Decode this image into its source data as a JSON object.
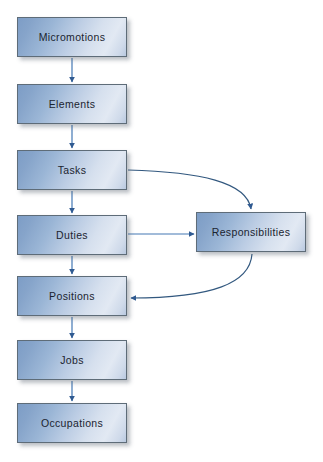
{
  "diagram": {
    "type": "flowchart",
    "background_color": "#ffffff",
    "node_fill_light": "#e2e9f3",
    "node_fill_dark": "#7d9dc6",
    "node_border_color": "#5e6c78",
    "connector_color": "#3b669e",
    "nodes": [
      {
        "id": "micromotions",
        "label": "Micromotions",
        "column": "left",
        "order": 1
      },
      {
        "id": "elements",
        "label": "Elements",
        "column": "left",
        "order": 2
      },
      {
        "id": "tasks",
        "label": "Tasks",
        "column": "left",
        "order": 3
      },
      {
        "id": "duties",
        "label": "Duties",
        "column": "left",
        "order": 4
      },
      {
        "id": "positions",
        "label": "Positions",
        "column": "left",
        "order": 5
      },
      {
        "id": "jobs",
        "label": "Jobs",
        "column": "left",
        "order": 6
      },
      {
        "id": "occupations",
        "label": "Occupations",
        "column": "left",
        "order": 7
      },
      {
        "id": "responsibilities",
        "label": "Responsibilities",
        "column": "right",
        "order": 1
      }
    ],
    "connectors": [
      {
        "id": "micromotions-to-elements",
        "from": "micromotions",
        "to": "elements",
        "style": "straight-vertical"
      },
      {
        "id": "elements-to-tasks",
        "from": "elements",
        "to": "tasks",
        "style": "straight-vertical"
      },
      {
        "id": "tasks-to-duties",
        "from": "tasks",
        "to": "duties",
        "style": "straight-vertical"
      },
      {
        "id": "duties-to-positions",
        "from": "duties",
        "to": "positions",
        "style": "straight-vertical"
      },
      {
        "id": "positions-to-jobs",
        "from": "positions",
        "to": "jobs",
        "style": "straight-vertical"
      },
      {
        "id": "jobs-to-occupations",
        "from": "jobs",
        "to": "occupations",
        "style": "straight-vertical"
      },
      {
        "id": "tasks-to-responsibilities",
        "from": "tasks",
        "to": "responsibilities",
        "style": "curved"
      },
      {
        "id": "duties-to-responsibilities",
        "from": "duties",
        "to": "responsibilities",
        "style": "straight-horizontal"
      },
      {
        "id": "responsibilities-to-positions",
        "from": "responsibilities",
        "to": "positions",
        "style": "curved"
      }
    ]
  }
}
